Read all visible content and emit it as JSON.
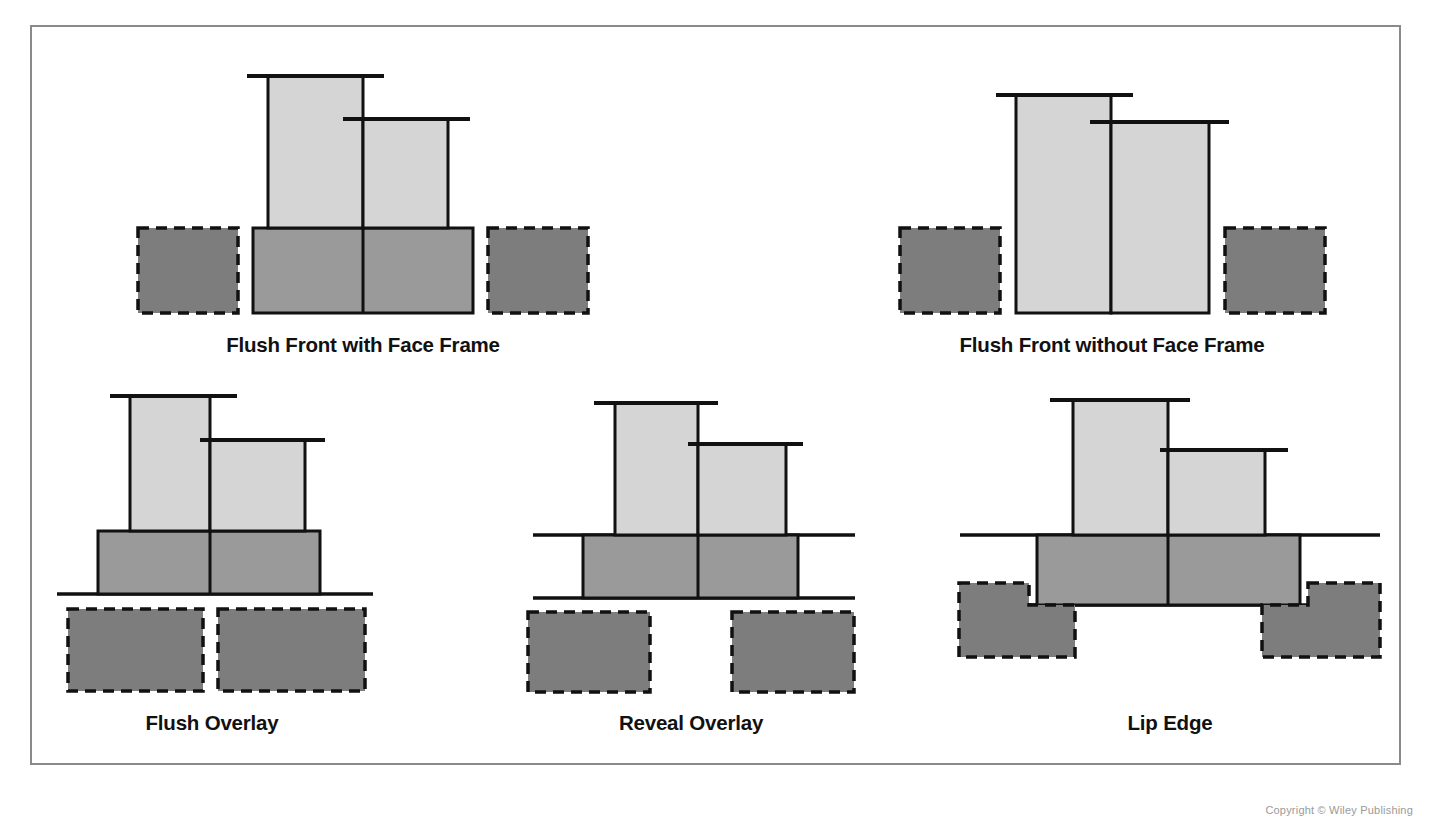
{
  "figure": {
    "border_color": "#8a8a8a",
    "background": "#ffffff"
  },
  "colors": {
    "door_panel_light": "#d5d5d5",
    "cabinet_block_mid": "#9a9a9a",
    "frame_dashed_dark": "#7d7d7d",
    "outline": "#111111",
    "label_text": "#111111"
  },
  "legend_semantics": {
    "light_panel": "door or drawer front (shown in section)",
    "mid_block": "cabinet box / door body in section",
    "dashed_block": "face frame or cabinet side member (hidden / dashed)"
  },
  "diagrams": [
    {
      "id": "flush-front-with-face-frame",
      "label": "Flush Front with Face Frame",
      "row": 1,
      "column": 1,
      "description": "Door and drawer front set flush inside an opening created by a face frame; dashed face frame members sit to each side with a small gap."
    },
    {
      "id": "flush-front-without-face-frame",
      "label": "Flush Front without Face Frame",
      "row": 1,
      "column": 2,
      "description": "Frameless construction with the front set flush between the cabinet side panels; fronts run full height to the base."
    },
    {
      "id": "flush-overlay",
      "label": "Flush Overlay",
      "row": 2,
      "column": 1,
      "description": "Fronts overlay the cabinet face completely with adjacent fronts nearly touching; dashed members below are continuous across."
    },
    {
      "id": "reveal-overlay",
      "label": "Reveal Overlay",
      "row": 2,
      "column": 2,
      "description": "Fronts overlay the cabinet face but a margin of frame remains exposed, producing a visible reveal between fronts."
    },
    {
      "id": "lip-edge",
      "label": "Lip Edge",
      "row": 2,
      "column": 3,
      "description": "Fronts are rabbeted so a lip projects into the opening; the dashed members show the stepped L-shaped rabbet on each side."
    }
  ],
  "credit": "Copyright © Wiley Publishing"
}
